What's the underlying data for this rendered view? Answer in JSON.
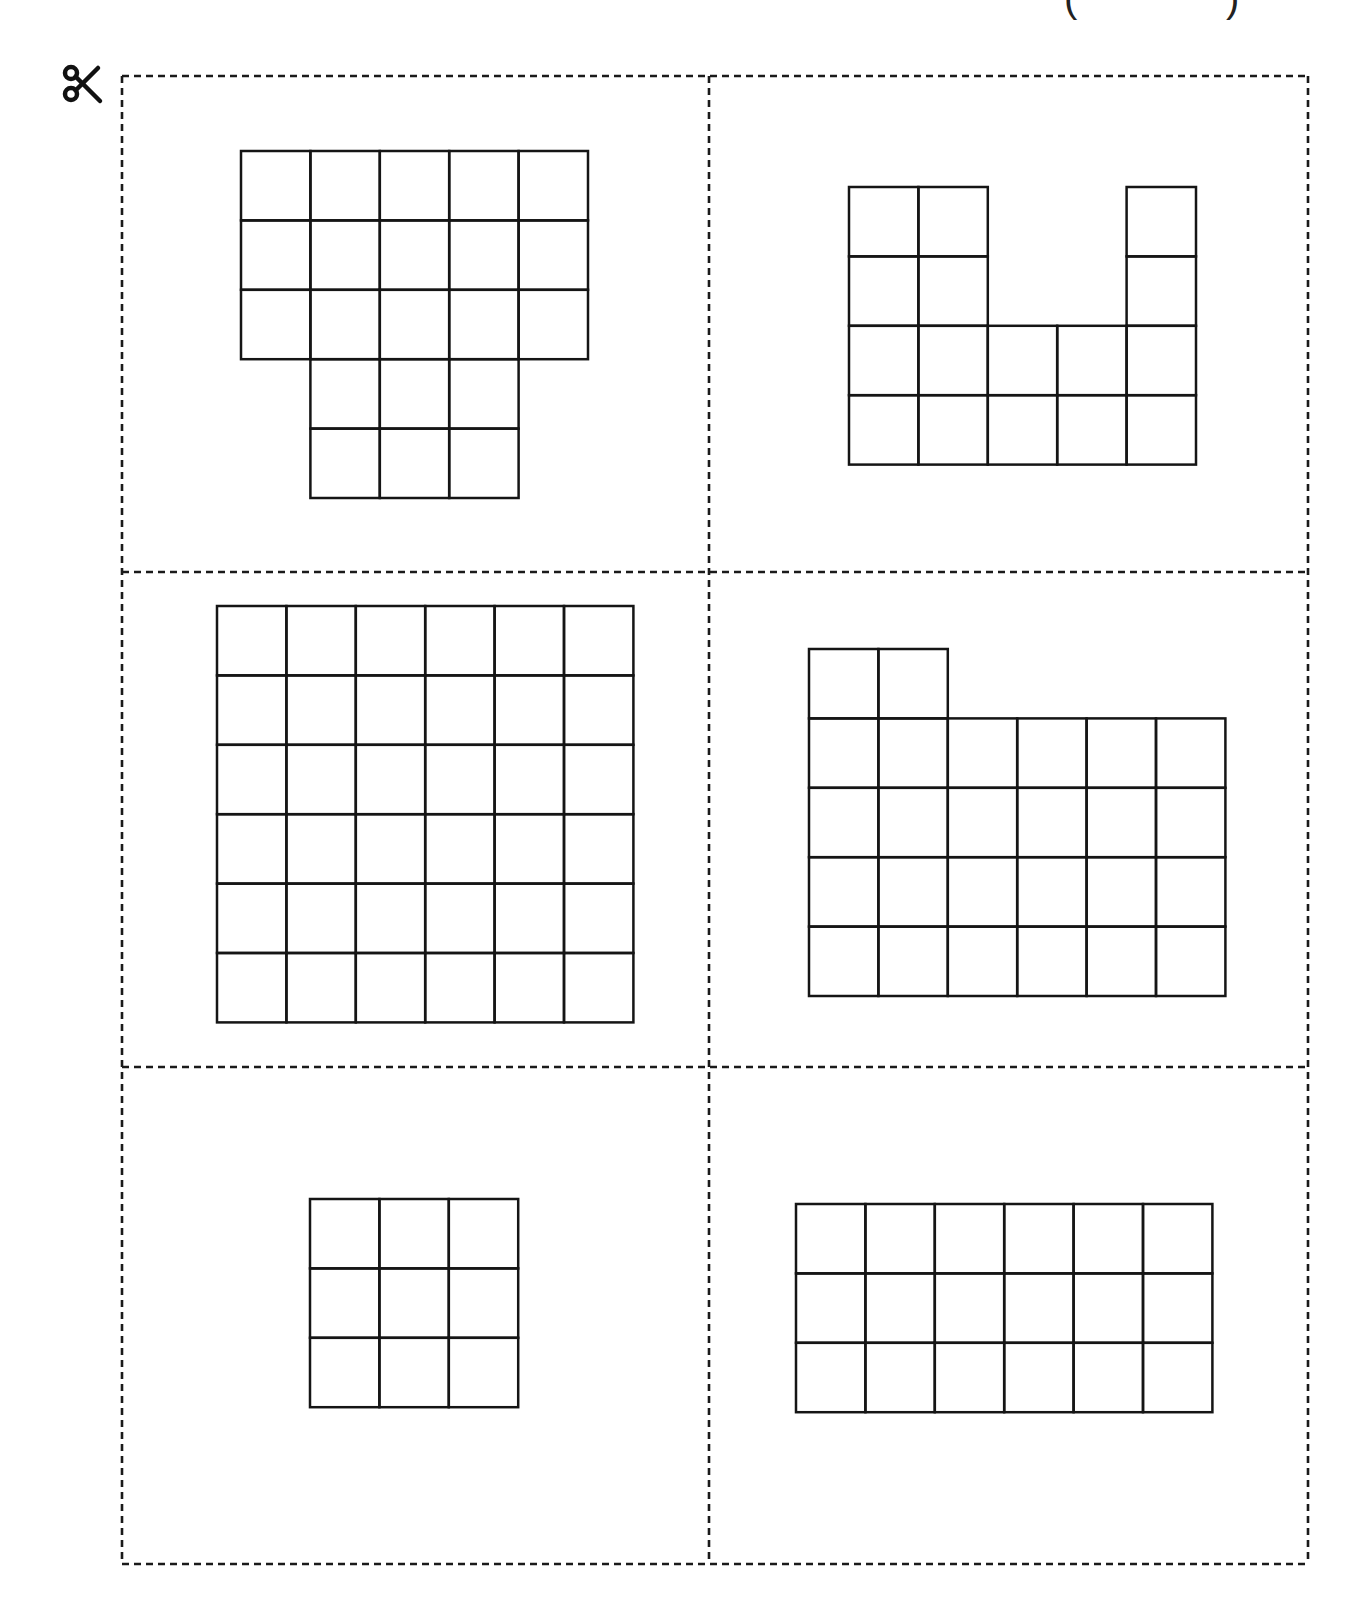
{
  "header": {
    "paren_left": "(",
    "paren_right": ")"
  },
  "icons": {
    "scissors": "scissors-icon"
  },
  "sheet": {
    "frame": {
      "left": 122,
      "top": 76,
      "right": 1308,
      "bottom": 1564
    },
    "dividers": {
      "vertical_x": 709,
      "horizontal_y": [
        572,
        1067
      ]
    },
    "line_color": "#1a1a1a",
    "dash": "7,5"
  },
  "grid": {
    "cell_size": 69.4,
    "line_color": "#151515",
    "line_width": 2.5
  },
  "cards": [
    {
      "id": "card-1",
      "description": "Shape of 21 unit squares: 5x3 rectangle with 3x2 block below the middle three columns",
      "unit_squares": 21,
      "origin": [
        241,
        151
      ],
      "cells": [
        [
          1,
          1,
          1,
          1,
          1
        ],
        [
          1,
          1,
          1,
          1,
          1
        ],
        [
          1,
          1,
          1,
          1,
          1
        ],
        [
          0,
          1,
          1,
          1,
          0
        ],
        [
          0,
          1,
          1,
          1,
          0
        ]
      ]
    },
    {
      "id": "card-2",
      "description": "U-shaped figure of 16 unit squares in a 5x4 bounding box",
      "unit_squares": 16,
      "origin": [
        849,
        187
      ],
      "cells": [
        [
          1,
          1,
          0,
          0,
          1
        ],
        [
          1,
          1,
          0,
          0,
          1
        ],
        [
          1,
          1,
          1,
          1,
          1
        ],
        [
          1,
          1,
          1,
          1,
          1
        ]
      ]
    },
    {
      "id": "card-3",
      "description": "6x6 square of 36 unit squares",
      "unit_squares": 36,
      "origin": [
        217,
        606
      ],
      "cells": [
        [
          1,
          1,
          1,
          1,
          1,
          1
        ],
        [
          1,
          1,
          1,
          1,
          1,
          1
        ],
        [
          1,
          1,
          1,
          1,
          1,
          1
        ],
        [
          1,
          1,
          1,
          1,
          1,
          1
        ],
        [
          1,
          1,
          1,
          1,
          1,
          1
        ],
        [
          1,
          1,
          1,
          1,
          1,
          1
        ]
      ]
    },
    {
      "id": "card-4",
      "description": "6x4 rectangle with two extra squares on top left, 26 unit squares",
      "unit_squares": 26,
      "origin": [
        809,
        649
      ],
      "cells": [
        [
          1,
          1,
          0,
          0,
          0,
          0
        ],
        [
          1,
          1,
          1,
          1,
          1,
          1
        ],
        [
          1,
          1,
          1,
          1,
          1,
          1
        ],
        [
          1,
          1,
          1,
          1,
          1,
          1
        ],
        [
          1,
          1,
          1,
          1,
          1,
          1
        ]
      ]
    },
    {
      "id": "card-5",
      "description": "3x3 square of 9 unit squares",
      "unit_squares": 9,
      "origin": [
        310,
        1199
      ],
      "cells": [
        [
          1,
          1,
          1
        ],
        [
          1,
          1,
          1
        ],
        [
          1,
          1,
          1
        ]
      ]
    },
    {
      "id": "card-6",
      "description": "6x3 rectangle of 18 unit squares",
      "unit_squares": 18,
      "origin": [
        796,
        1204
      ],
      "cells": [
        [
          1,
          1,
          1,
          1,
          1,
          1
        ],
        [
          1,
          1,
          1,
          1,
          1,
          1
        ],
        [
          1,
          1,
          1,
          1,
          1,
          1
        ]
      ]
    }
  ]
}
